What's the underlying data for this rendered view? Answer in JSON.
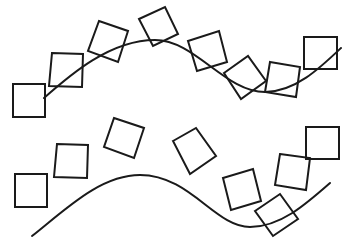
{
  "diagram": {
    "colors": {
      "background": "#ffffff",
      "stroke": "#1a1a1a"
    },
    "groups": [
      {
        "id": "top-row",
        "square_count": 8,
        "curve": "sine-like wave, rising, peak, trough, rising",
        "square_rotations_deg": [
          0,
          2,
          18,
          -25,
          -17,
          -36,
          9,
          0
        ]
      },
      {
        "id": "bottom-row",
        "square_count": 8,
        "curve": "sine-like wave, rising, peak, trough, rising",
        "square_rotations_deg": [
          0,
          2,
          18,
          -30,
          -17,
          -34,
          8,
          0
        ]
      }
    ]
  }
}
